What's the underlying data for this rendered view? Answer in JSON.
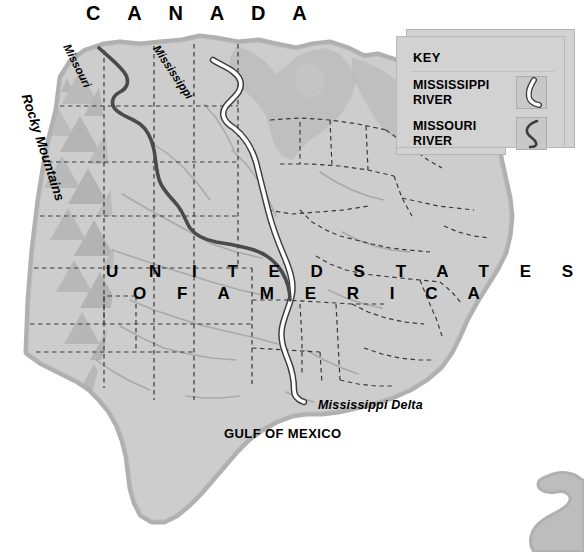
{
  "map": {
    "title": "Map of the United States showing the Mississippi and Missouri Rivers",
    "labels": {
      "canada": "C A N A D A",
      "country_line1": "U N I T E D  S T A T E S",
      "country_line2": "O F  A M E R I C A",
      "gulf": "GULF OF MEXICO",
      "delta": "Mississippi Delta",
      "rockies": "Rocky Mountains",
      "river_missouri": "Missouri",
      "river_mississippi": "Mississippi"
    },
    "colors": {
      "land": "#cdcdcd",
      "land_shade": "#bcbcbc",
      "coast_halo": "#b0b0b0",
      "mountains": "#bdbdbd",
      "border_dash": "#3a3a3a",
      "river_mississippi": "#ffffff",
      "river_mississippi_edge": "#3c3c3c",
      "river_missouri": "#4a4a4a",
      "tributary": "#a9a9a9",
      "key_panel": "#d2d2d2",
      "key_swatch": "#c8c8c8",
      "text": "#000000",
      "background": "#ffffff"
    }
  },
  "key": {
    "title": "KEY",
    "entries": [
      {
        "label_line1": "MISSISSIPPI",
        "label_line2": "RIVER",
        "swatch": "white-curve-line",
        "color": "#ffffff"
      },
      {
        "label_line1": "MISSOURI",
        "label_line2": "RIVER",
        "swatch": "dark-curve-line",
        "color": "#3c3c3c"
      }
    ]
  }
}
